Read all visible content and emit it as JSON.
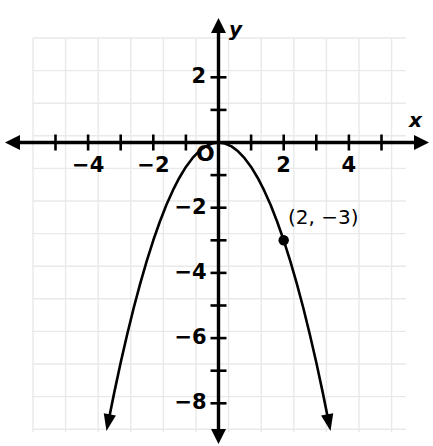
{
  "chart_data": {
    "type": "line",
    "title": "",
    "subtitle": "",
    "xlabel": "x",
    "ylabel": "y",
    "xlim": [
      -5.7,
      6.4
    ],
    "ylim": [
      -9.3,
      3.2
    ],
    "grid": true,
    "grid_step": 1,
    "grid_color": "#e9e9e9",
    "curve_color": "#000000",
    "axis_color": "#000000",
    "legend": null,
    "function": "y = -0.75x^2",
    "vertex": [
      0,
      0
    ],
    "x_tick_values": [
      -5,
      -4,
      -3,
      -2,
      -1,
      1,
      2,
      3,
      4,
      5
    ],
    "x_tick_labels": [
      {
        "value": -4,
        "text": "−4"
      },
      {
        "value": -2,
        "text": "−2"
      },
      {
        "value": 2,
        "text": "2"
      },
      {
        "value": 4,
        "text": "4"
      }
    ],
    "y_tick_values": [
      2,
      1,
      -1,
      -2,
      -3,
      -4,
      -5,
      -6,
      -7,
      -8
    ],
    "y_tick_labels": [
      {
        "value": 2,
        "text": "2"
      },
      {
        "value": -2,
        "text": "−2"
      },
      {
        "value": -4,
        "text": "−4"
      },
      {
        "value": -6,
        "text": "−6"
      },
      {
        "value": -8,
        "text": "−8"
      }
    ],
    "origin_label": "O",
    "series": [
      {
        "name": "parabola",
        "points": [
          [
            -3.4,
            -8.67
          ],
          [
            -3.2,
            -7.68
          ],
          [
            -3.0,
            -6.75
          ],
          [
            -2.8,
            -5.88
          ],
          [
            -2.6,
            -5.07
          ],
          [
            -2.4,
            -4.32
          ],
          [
            -2.2,
            -3.63
          ],
          [
            -2.0,
            -3.0
          ],
          [
            -1.8,
            -2.43
          ],
          [
            -1.6,
            -1.92
          ],
          [
            -1.4,
            -1.47
          ],
          [
            -1.2,
            -1.08
          ],
          [
            -1.0,
            -0.75
          ],
          [
            -0.8,
            -0.48
          ],
          [
            -0.6,
            -0.27
          ],
          [
            -0.4,
            -0.12
          ],
          [
            -0.2,
            -0.03
          ],
          [
            0.0,
            0.0
          ],
          [
            0.2,
            -0.03
          ],
          [
            0.4,
            -0.12
          ],
          [
            0.6,
            -0.27
          ],
          [
            0.8,
            -0.48
          ],
          [
            1.0,
            -0.75
          ],
          [
            1.2,
            -1.08
          ],
          [
            1.4,
            -1.47
          ],
          [
            1.6,
            -1.92
          ],
          [
            1.8,
            -2.43
          ],
          [
            2.0,
            -3.0
          ],
          [
            2.2,
            -3.63
          ],
          [
            2.4,
            -4.32
          ],
          [
            2.6,
            -5.07
          ],
          [
            2.8,
            -5.88
          ],
          [
            3.0,
            -6.75
          ],
          [
            3.2,
            -7.68
          ],
          [
            3.4,
            -8.67
          ]
        ]
      }
    ],
    "annotations": [
      {
        "name": "marked-point",
        "x": 2,
        "y": -3,
        "label": "(2, −3)",
        "marker": "filled-circle"
      }
    ]
  }
}
